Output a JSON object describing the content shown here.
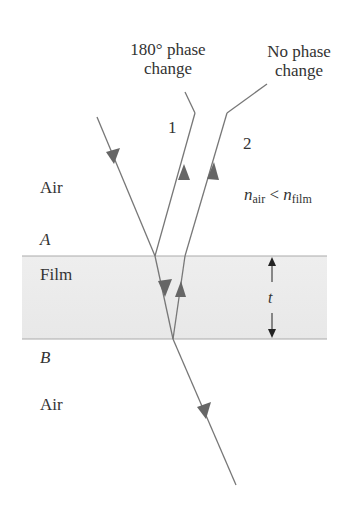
{
  "diagram": {
    "title_ray1": "180° phase change",
    "ray1_line1": "180° phase",
    "ray1_line2": "change",
    "ray2_line1": "No phase",
    "ray2_line2": "change",
    "ray1_number": "1",
    "ray2_number": "2",
    "top_medium": "Air",
    "film_label": "Film",
    "bottom_medium": "Air",
    "interface_top": "A",
    "interface_bottom": "B",
    "thickness_label": "t",
    "relation": {
      "n_symbol": "n",
      "sub_air": "air",
      "op": "<",
      "sub_film": "film"
    },
    "colors": {
      "film_fill": "#ececec",
      "ray": "#777777",
      "arrow": "#666666",
      "text": "#333333"
    }
  }
}
